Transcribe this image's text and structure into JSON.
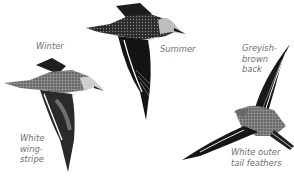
{
  "illustration": {
    "subject": "sandpiper in flight",
    "labels": {
      "winter": "Winter",
      "summer": "Summer",
      "back": [
        "Greyish-",
        "brown",
        "back"
      ],
      "wingstripe": [
        "White",
        "wing-",
        "stripe"
      ],
      "tail": [
        "White outer",
        "tail feathers"
      ]
    },
    "colors": {
      "background": "#ffffff",
      "label_text": "#6f6f6f",
      "dark_plumage": "#1a1a1a",
      "grey_plumage": "#9a9a9a",
      "light_plumage": "#d6d6d6"
    }
  }
}
